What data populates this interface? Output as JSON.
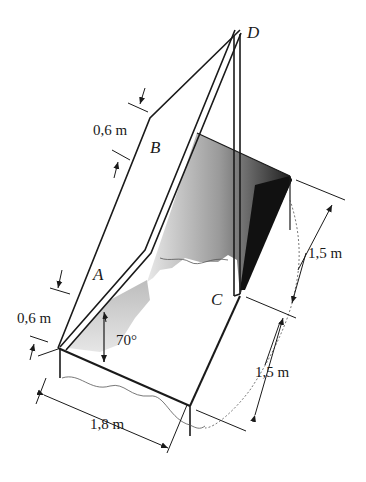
{
  "figure": {
    "points": {
      "A": "A",
      "B": "B",
      "C": "C",
      "D": "D"
    },
    "dimensions": {
      "top_offset": "0,6 m",
      "bottom_offset": "0,6 m",
      "upper_depth": "1,5 m",
      "lower_depth": "1,5 m",
      "width": "1,8 m",
      "angle": "70°"
    },
    "colors": {
      "line": "#1a1a1a",
      "shade_dark": "#222222",
      "shade_light": "#d0d0d0",
      "background": "#ffffff"
    }
  }
}
